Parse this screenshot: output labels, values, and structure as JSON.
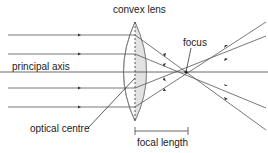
{
  "diagram": {
    "labels": {
      "lens": "convex lens",
      "focus": "focus",
      "axis": "principal axis",
      "optical_centre": "optical centre",
      "focal_length": "focal length"
    },
    "colors": {
      "ray": "#555555",
      "lens_fill": "#e6e6e6",
      "lens_stroke": "#777777",
      "text": "#222222"
    },
    "rays_incident_y": [
      35,
      54,
      72,
      88,
      107
    ],
    "lens_centre_x": 135,
    "focus_point": [
      186,
      72
    ]
  }
}
